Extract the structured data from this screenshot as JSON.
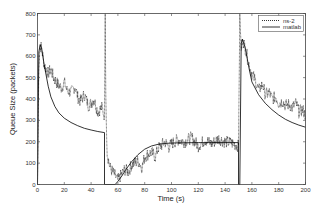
{
  "chart_data": {
    "type": "line",
    "title": "",
    "xlabel": "Time (s)",
    "ylabel": "Queue Size (packets)",
    "xlim": [
      0,
      200
    ],
    "ylim": [
      0,
      800
    ],
    "xticks": [
      0,
      20,
      40,
      60,
      80,
      100,
      120,
      140,
      160,
      180,
      200
    ],
    "yticks": [
      0,
      100,
      200,
      300,
      400,
      500,
      600,
      700,
      800
    ],
    "grid": false,
    "legend_position": "upper right",
    "series": [
      {
        "name": "ns-2",
        "style": "dotted, noisy",
        "color": "#000000",
        "x": [
          0,
          1,
          2,
          3,
          5,
          8,
          10,
          12,
          15,
          18,
          20,
          22,
          25,
          28,
          30,
          32,
          35,
          38,
          40,
          42,
          45,
          48,
          50,
          50.5,
          51,
          52,
          54,
          56,
          58,
          60,
          62,
          65,
          68,
          70,
          72,
          75,
          78,
          80,
          82,
          85,
          88,
          90,
          92,
          95,
          98,
          100,
          105,
          110,
          115,
          120,
          125,
          130,
          135,
          140,
          145,
          150,
          151,
          152,
          153,
          155,
          158,
          160,
          163,
          165,
          168,
          170,
          173,
          175,
          178,
          180,
          183,
          185,
          188,
          190,
          193,
          195,
          198,
          200
        ],
        "values": [
          0,
          560,
          650,
          640,
          560,
          520,
          540,
          500,
          470,
          450,
          480,
          440,
          430,
          460,
          410,
          390,
          420,
          370,
          380,
          400,
          340,
          360,
          320,
          800,
          400,
          150,
          80,
          60,
          40,
          20,
          40,
          70,
          60,
          90,
          100,
          110,
          80,
          130,
          140,
          150,
          130,
          170,
          180,
          200,
          175,
          190,
          210,
          200,
          220,
          180,
          210,
          190,
          215,
          200,
          195,
          180,
          800,
          620,
          680,
          640,
          560,
          520,
          480,
          440,
          470,
          420,
          430,
          400,
          410,
          380,
          390,
          370,
          375,
          360,
          380,
          340,
          350,
          320
        ]
      },
      {
        "name": "matlab",
        "style": "solid",
        "color": "#000000",
        "x": [
          0,
          1,
          2,
          3,
          5,
          8,
          10,
          13,
          16,
          20,
          25,
          30,
          35,
          40,
          45,
          50,
          50.01,
          58,
          60,
          63,
          66,
          70,
          75,
          80,
          85,
          90,
          95,
          100,
          110,
          120,
          130,
          140,
          150,
          150.01,
          151,
          152,
          153,
          155,
          158,
          160,
          165,
          170,
          175,
          180,
          185,
          190,
          195,
          200
        ],
        "values": [
          0,
          620,
          655,
          640,
          560,
          460,
          410,
          365,
          335,
          310,
          290,
          275,
          263,
          255,
          248,
          243,
          0,
          0,
          15,
          40,
          70,
          105,
          140,
          165,
          180,
          188,
          192,
          194,
          195,
          196,
          196,
          196,
          196,
          0,
          0,
          660,
          680,
          640,
          540,
          480,
          420,
          380,
          350,
          325,
          305,
          290,
          278,
          268
        ]
      }
    ]
  },
  "legend": {
    "entries": [
      "ns-2",
      "matlab"
    ]
  }
}
